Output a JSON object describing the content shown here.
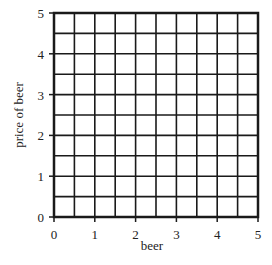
{
  "chart_data": {
    "type": "scatter",
    "title": "",
    "xlabel": "beer",
    "ylabel": "price of beer",
    "xlim": [
      0,
      5
    ],
    "ylim": [
      0,
      5
    ],
    "x_ticks": [
      "0",
      "1",
      "2",
      "3",
      "4",
      "5"
    ],
    "y_ticks": [
      "0",
      "1",
      "2",
      "3",
      "4",
      "5"
    ],
    "grid": true,
    "grid_step": 0.5,
    "series": [],
    "legend": null
  },
  "colors": {
    "grid": "#1a1a1a",
    "background": "#ffffff",
    "text": "#222222"
  }
}
